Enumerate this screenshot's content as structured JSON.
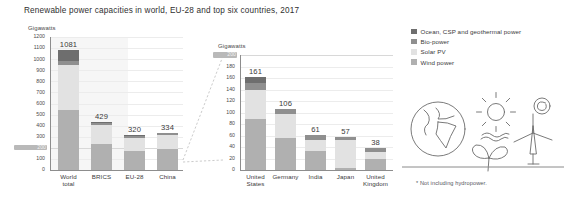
{
  "title": "Renewable power capacities in world, EU-28 and top six countries, 2017",
  "footnote": "* Not including hydropower.",
  "colors": {
    "ocean_csp_geothermal": "#6e6e6e",
    "bio_power": "#8f8f8f",
    "solar_pv": "#e2e2e2",
    "wind_power": "#b0b0b0",
    "plot_background": "#f6f6f6",
    "gridline": "#ececec",
    "axis": "#8d8d8d",
    "text": "#3a3a3a",
    "highlight_tick_bg": "#b9b9b9"
  },
  "legend": {
    "position": "right",
    "items": [
      {
        "label": "Ocean, CSP and geothermal power",
        "color": "#6e6e6e",
        "icon": "legend-swatch-icon"
      },
      {
        "label": "Bio-power",
        "color": "#8f8f8f",
        "icon": "legend-swatch-icon"
      },
      {
        "label": "Solar PV",
        "color": "#e2e2e2",
        "icon": "legend-swatch-icon"
      },
      {
        "label": "Wind power",
        "color": "#b0b0b0",
        "icon": "legend-swatch-icon"
      }
    ]
  },
  "illustration": {
    "name": "renewable-energy-illustration",
    "elements": [
      "globe",
      "sun",
      "waves",
      "leaf",
      "wind-turbine",
      "spiral-geothermal"
    ]
  },
  "chart_data": [
    {
      "id": "world-chart",
      "type": "bar",
      "stacked": true,
      "title": "",
      "xlabel": "",
      "ylabel": "Gigawatts",
      "ylim": [
        0,
        1200
      ],
      "ytick_step": 100,
      "yticks": [
        0,
        100,
        200,
        300,
        400,
        500,
        600,
        700,
        800,
        900,
        1000,
        1100,
        1200
      ],
      "highlight_tick": 200,
      "grid": true,
      "categories": [
        "World\ntotal",
        "BRICS",
        "EU-28",
        "China"
      ],
      "category_labels": [
        "World total",
        "BRICS",
        "EU-28",
        "China"
      ],
      "totals": [
        1081,
        429,
        320,
        334
      ],
      "series": [
        {
          "name": "Wind power",
          "color": "#b0b0b0",
          "values": [
            539,
            234,
            169,
            188
          ]
        },
        {
          "name": "Solar PV",
          "color": "#e2e2e2",
          "values": [
            405,
            168,
            116,
            131
          ]
        },
        {
          "name": "Bio-power",
          "color": "#8f8f8f",
          "values": [
            37,
            19,
            22,
            13
          ]
        },
        {
          "name": "Ocean, CSP and geothermal power",
          "color": "#6e6e6e",
          "values": [
            100,
            8,
            13,
            2
          ]
        }
      ]
    },
    {
      "id": "countries-chart",
      "type": "bar",
      "stacked": true,
      "title": "",
      "xlabel": "",
      "ylabel": "Gigawatts",
      "ylim": [
        0,
        200
      ],
      "ytick_step": 20,
      "yticks": [
        0,
        20,
        40,
        60,
        80,
        100,
        120,
        140,
        160,
        180,
        200
      ],
      "highlight_tick": 200,
      "grid": true,
      "categories": [
        "United\nStates",
        "Germany",
        "India",
        "Japan",
        "United\nKingdom"
      ],
      "category_labels": [
        "United States",
        "Germany",
        "India",
        "Japan",
        "United Kingdom"
      ],
      "totals": [
        161,
        106,
        61,
        57,
        38
      ],
      "series": [
        {
          "name": "Wind power",
          "color": "#b0b0b0",
          "values": [
            89,
            56,
            33,
            3.4,
            19
          ]
        },
        {
          "name": "Solar PV",
          "color": "#e2e2e2",
          "values": [
            51,
            42,
            19,
            49,
            13
          ]
        },
        {
          "name": "Bio-power",
          "color": "#8f8f8f",
          "values": [
            12,
            7.4,
            8.5,
            4.3,
            5.5
          ]
        },
        {
          "name": "Ocean, CSP and geothermal power",
          "color": "#6e6e6e",
          "values": [
            9,
            0.6,
            0.5,
            0.3,
            0.5
          ]
        }
      ]
    }
  ]
}
